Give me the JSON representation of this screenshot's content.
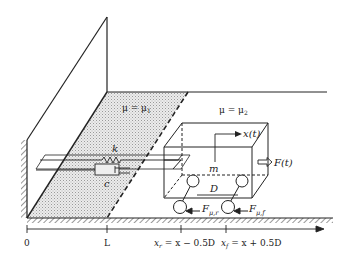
{
  "diagram": {
    "type": "mechanical-model",
    "regions": {
      "region1_label": "μ = μ",
      "region1_sub": "1",
      "region2_label": "μ = μ",
      "region2_sub": "2"
    },
    "spring_label": "k",
    "damper_label": "c",
    "mass_label": "m",
    "displacement_label": "x(t)",
    "force_label": "F(t)",
    "wheelbase_label": "D",
    "friction_rear": {
      "main": "F",
      "sub": "μ,r"
    },
    "friction_front": {
      "main": "F",
      "sub": "μ,f"
    },
    "axis": {
      "ticks": [
        {
          "label": "0"
        },
        {
          "label": "L"
        },
        {
          "label_main": "x",
          "label_sub": "r",
          "label_rest": " = x − 0.5D"
        },
        {
          "label_main": "x",
          "label_sub": "f",
          "label_rest": " = x + 0.5D"
        }
      ]
    },
    "colors": {
      "line": "#222222",
      "shade": "#d9d9d9"
    }
  }
}
